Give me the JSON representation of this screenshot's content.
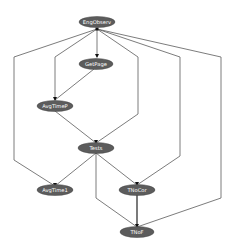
{
  "diagram": {
    "type": "directed-graph",
    "node_color": "#5c5c5c",
    "label_color": "#ffffff",
    "edge_color": "#5a5a5a",
    "nodes": [
      {
        "id": "n0",
        "label": "EngObserv",
        "cx": 97,
        "cy": 22
      },
      {
        "id": "n1",
        "label": "GetPage",
        "cx": 96,
        "cy": 64
      },
      {
        "id": "n2",
        "label": "AvgTimeP",
        "cx": 55,
        "cy": 106
      },
      {
        "id": "n3",
        "label": "Tests",
        "cx": 96,
        "cy": 148
      },
      {
        "id": "n4",
        "label": "AvgTime1",
        "cx": 55,
        "cy": 190
      },
      {
        "id": "n5",
        "label": "TNoCor",
        "cx": 137,
        "cy": 190
      },
      {
        "id": "n6",
        "label": "TNoF",
        "cx": 137,
        "cy": 232
      }
    ],
    "edges": [
      {
        "from": "EngObserv",
        "to": "GetPage"
      },
      {
        "from": "EngObserv",
        "to": "AvgTime1"
      },
      {
        "from": "EngObserv",
        "to": "AvgTimeP"
      },
      {
        "from": "EngObserv",
        "to": "Tests"
      },
      {
        "from": "EngObserv",
        "to": "TNoCor"
      },
      {
        "from": "EngObserv",
        "to": "TNoF"
      },
      {
        "from": "GetPage",
        "to": "AvgTimeP"
      },
      {
        "from": "AvgTimeP",
        "to": "Tests"
      },
      {
        "from": "Tests",
        "to": "AvgTime1"
      },
      {
        "from": "Tests",
        "to": "TNoCor"
      },
      {
        "from": "Tests",
        "to": "TNoF"
      },
      {
        "from": "TNoCor",
        "to": "TNoF"
      }
    ]
  }
}
